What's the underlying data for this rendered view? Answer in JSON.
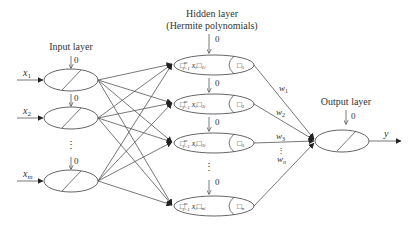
{
  "labels": {
    "input_layer": "Input layer",
    "hidden_layer_line1": "Hidden layer",
    "hidden_layer_line2": "(Hermite polynomials)",
    "output_layer": "Output layer"
  },
  "bias": "0",
  "inputs": [
    {
      "var": "x",
      "sub": "1"
    },
    {
      "var": "x",
      "sub": "2"
    },
    {
      "var": "x",
      "sub": "m"
    }
  ],
  "hidden_nodes": [
    {
      "sum": "□",
      "sum_sup": "m",
      "sum_sub": "i=1",
      "xi": "x",
      "xi_sub": "i",
      "coef": "□",
      "coef_sub": "1i",
      "act": "□",
      "act_sub": "1"
    },
    {
      "sum": "□",
      "sum_sup": "m",
      "sum_sub": "i=1",
      "xi": "x",
      "xi_sub": "i",
      "coef": "□",
      "coef_sub": "2i",
      "act": "□",
      "act_sub": "2"
    },
    {
      "sum": "□",
      "sum_sup": "m",
      "sum_sub": "i=1",
      "xi": "x",
      "xi_sub": "i",
      "coef": "□",
      "coef_sub": "3i",
      "act": "□",
      "act_sub": "3"
    },
    {
      "sum": "□",
      "sum_sup": "m",
      "sum_sub": "i=1",
      "xi": "x",
      "xi_sub": "i",
      "coef": "□",
      "coef_sub": "ni",
      "act": "□",
      "act_sub": "n"
    }
  ],
  "weights": [
    {
      "var": "w",
      "sub": "1"
    },
    {
      "var": "w",
      "sub": "2"
    },
    {
      "var": "w",
      "sub": "3"
    },
    {
      "var": "w",
      "sub": "n"
    }
  ],
  "output": {
    "var": "y"
  },
  "ellipsis": "⋮"
}
